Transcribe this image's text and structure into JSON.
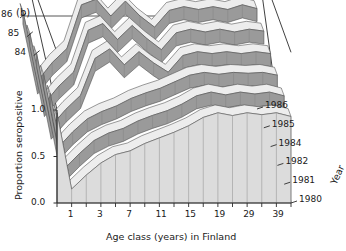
{
  "figure": {
    "panel_label": "(b)",
    "type_note": "3d-ribbon-surface"
  },
  "axes": {
    "y": {
      "title": "Proportion seropositive",
      "ticks": [
        "0.0",
        "0.5",
        "1.0"
      ],
      "values": [
        0.0,
        0.5,
        1.0
      ],
      "range": [
        0.0,
        1.0
      ]
    },
    "x": {
      "title": "Age class (years) in Finland",
      "ticks": [
        "1",
        "3",
        "7",
        "11",
        "15",
        "19",
        "29",
        "39"
      ],
      "tick_index": [
        1,
        3,
        5,
        7,
        9,
        11,
        13,
        15
      ]
    },
    "z": {
      "title": "Year",
      "ticks": [
        "1980",
        "1981",
        "1982",
        "1984",
        "1985",
        "1986"
      ],
      "upper_ticks": [
        "84",
        "85",
        "86"
      ]
    }
  },
  "colors": {
    "front_face": "#dcdcdc",
    "side_face": "#9a9a9a",
    "top_face": "#ededed",
    "outline": "#4a4a4a",
    "grid": "#8c8c8c",
    "axis": "#2b2b2b",
    "background": "#ffffff"
  },
  "chart_data": {
    "type": "area",
    "title": "",
    "subtitle": "",
    "xlabel": "Age class (years) in Finland",
    "ylabel": "Proportion seropositive",
    "zlabel": "Year",
    "ylim": [
      0.0,
      1.0
    ],
    "grid": true,
    "legend_position": "right-depth-axis",
    "categories": [
      "0",
      "1",
      "2",
      "3",
      "5",
      "7",
      "9",
      "11",
      "13",
      "15",
      "17",
      "19",
      "24",
      "29",
      "34",
      "39",
      "44"
    ],
    "series": [
      {
        "name": "1980",
        "values": [
          0.97,
          0.15,
          0.3,
          0.43,
          0.52,
          0.56,
          0.64,
          0.7,
          0.76,
          0.83,
          0.92,
          0.97,
          0.94,
          0.97,
          0.95,
          0.97,
          0.93
        ]
      },
      {
        "name": "1981",
        "values": [
          0.98,
          0.17,
          0.33,
          0.47,
          0.55,
          0.6,
          0.68,
          0.74,
          0.79,
          0.86,
          0.95,
          0.99,
          0.96,
          0.99,
          0.97,
          0.99,
          0.95
        ]
      },
      {
        "name": "1982",
        "values": [
          0.99,
          0.19,
          0.36,
          0.5,
          0.58,
          0.64,
          0.72,
          0.78,
          0.83,
          0.9,
          0.97,
          1.0,
          0.98,
          1.0,
          0.99,
          1.0,
          0.97
        ]
      },
      {
        "name": "1984",
        "values": [
          1.0,
          0.22,
          0.4,
          0.55,
          0.95,
          1.05,
          0.88,
          1.02,
          0.9,
          0.8,
          0.98,
          1.02,
          1.0,
          1.02,
          1.0,
          1.02,
          1.0
        ]
      },
      {
        "name": "1985",
        "values": [
          1.02,
          0.26,
          0.45,
          0.6,
          1.05,
          1.12,
          0.95,
          1.1,
          0.96,
          0.84,
          1.02,
          1.06,
          1.03,
          1.06,
          1.03,
          1.06,
          1.04
        ]
      },
      {
        "name": "1986",
        "values": [
          1.05,
          0.3,
          0.5,
          0.65,
          1.12,
          1.18,
          1.0,
          1.16,
          1.0,
          0.88,
          1.06,
          1.1,
          1.07,
          1.1,
          1.07,
          1.12,
          1.08
        ]
      }
    ]
  }
}
